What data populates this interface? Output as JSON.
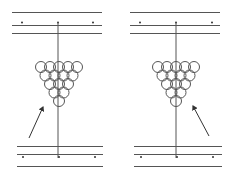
{
  "figure": {
    "stroke_color": "#333333",
    "background": "#ffffff",
    "panels": [
      {
        "id": "left",
        "rack_rows": [
          5,
          4,
          3,
          2,
          1
        ],
        "arrow_direction": "up-right"
      },
      {
        "id": "right",
        "rack_rows": [
          5,
          4,
          3,
          2,
          1
        ],
        "arrow_direction": "up-left"
      }
    ]
  }
}
